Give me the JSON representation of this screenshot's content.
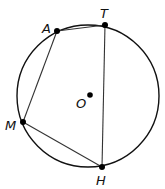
{
  "diagram": {
    "type": "inscribed-quadrilateral",
    "circle": {
      "center_label": "O",
      "cx": 88,
      "cy": 96,
      "r": 71
    },
    "points": [
      {
        "label": "A",
        "x": 57,
        "y": 31
      },
      {
        "label": "T",
        "x": 105,
        "y": 25
      },
      {
        "label": "H",
        "x": 102,
        "y": 167
      },
      {
        "label": "M",
        "x": 23,
        "y": 122
      }
    ],
    "center_dot": {
      "x": 90,
      "y": 95
    },
    "segments": [
      [
        "A",
        "T"
      ],
      [
        "T",
        "H"
      ],
      [
        "H",
        "M"
      ],
      [
        "M",
        "A"
      ]
    ],
    "colors": {
      "stroke": "#111111",
      "background": "#ffffff"
    }
  },
  "labels": {
    "A": "A",
    "T": "T",
    "M": "M",
    "H": "H",
    "O": "O"
  }
}
